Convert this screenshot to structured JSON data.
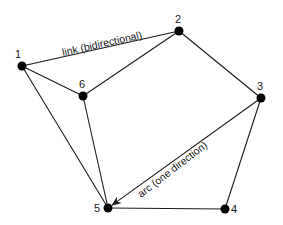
{
  "diagram": {
    "nodes": [
      {
        "id": "1",
        "label": "1",
        "x": 22,
        "y": 66,
        "lx": 15,
        "ly": 58
      },
      {
        "id": "2",
        "label": "2",
        "x": 179,
        "y": 31,
        "lx": 175,
        "ly": 23
      },
      {
        "id": "3",
        "label": "3",
        "x": 261,
        "y": 98,
        "lx": 257,
        "ly": 90
      },
      {
        "id": "4",
        "label": "4",
        "x": 225,
        "y": 209,
        "lx": 231,
        "ly": 213
      },
      {
        "id": "5",
        "label": "5",
        "x": 108,
        "y": 208,
        "lx": 94,
        "ly": 212
      },
      {
        "id": "6",
        "label": "6",
        "x": 83,
        "y": 96,
        "lx": 79,
        "ly": 88
      }
    ],
    "edges": [
      {
        "from": "1",
        "to": "2",
        "type": "link"
      },
      {
        "from": "1",
        "to": "6",
        "type": "link"
      },
      {
        "from": "1",
        "to": "5",
        "type": "link"
      },
      {
        "from": "6",
        "to": "2",
        "type": "link"
      },
      {
        "from": "6",
        "to": "5",
        "type": "link"
      },
      {
        "from": "2",
        "to": "3",
        "type": "link"
      },
      {
        "from": "3",
        "to": "4",
        "type": "link"
      },
      {
        "from": "4",
        "to": "5",
        "type": "link"
      },
      {
        "from": "3",
        "to": "5",
        "type": "arc"
      }
    ],
    "annotations": {
      "link_label": "link (bidirectional)",
      "arc_label": "arc (one direction)"
    }
  }
}
